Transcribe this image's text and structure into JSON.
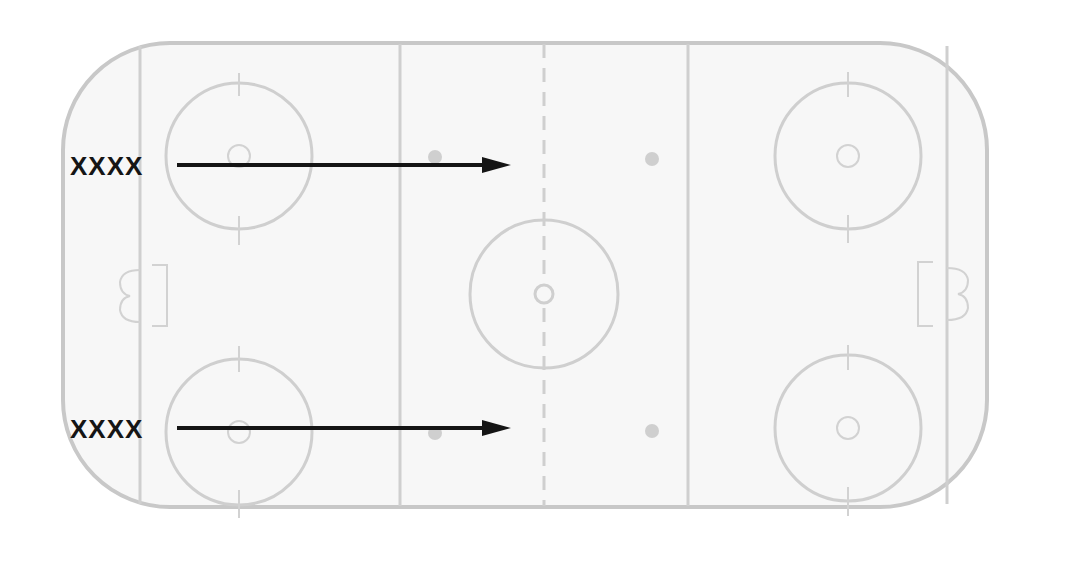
{
  "diagram": {
    "type": "hockey-rink-drill",
    "colors": {
      "rink_lines": "#cfcfcf",
      "rink_fill": "#f7f7f7",
      "markings": "#151515"
    },
    "players": [
      {
        "label": "XXXX",
        "row": "top",
        "arrow_direction": "right",
        "arrow_end": "center-line"
      },
      {
        "label": "XXXX",
        "row": "bottom",
        "arrow_direction": "right",
        "arrow_end": "center-line"
      }
    ],
    "rink_elements": {
      "goal_lines": 2,
      "blue_lines": 2,
      "center_line": "dashed",
      "faceoff_circles": 5,
      "neutral_zone_dots": 4,
      "goal_creases": 2
    }
  }
}
